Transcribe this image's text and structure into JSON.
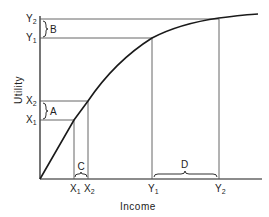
{
  "diagram": {
    "type": "utility-of-income-curve",
    "axes": {
      "x_label": "Income",
      "y_label": "Utility"
    },
    "y_ticks": [
      {
        "id": "Y2",
        "letter": "Y",
        "sub": "2",
        "y": 19
      },
      {
        "id": "Y1",
        "letter": "Y",
        "sub": "1",
        "y": 38
      },
      {
        "id": "X2",
        "letter": "X",
        "sub": "2",
        "y": 101
      },
      {
        "id": "X1",
        "letter": "X",
        "sub": "1",
        "y": 120
      }
    ],
    "x_ticks": [
      {
        "id": "X1",
        "letter": "X",
        "sub": "1",
        "x": 74
      },
      {
        "id": "X2",
        "letter": "X",
        "sub": "2",
        "x": 88
      },
      {
        "id": "Y1",
        "letter": "Y",
        "sub": "1",
        "x": 152
      },
      {
        "id": "Y2",
        "letter": "Y",
        "sub": "2",
        "x": 219
      }
    ],
    "brace_labels": {
      "A": "A",
      "B": "B",
      "C": "C",
      "D": "D"
    },
    "stroke_color": "#1a1a1a",
    "grid_line_color": "#555555"
  }
}
